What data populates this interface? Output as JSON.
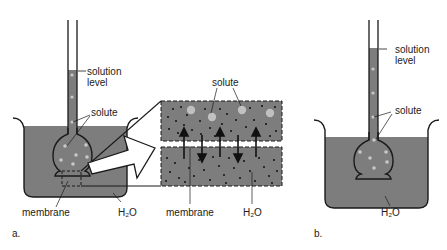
{
  "colors": {
    "water": "#7d7d7d",
    "outline": "#1a1a1a",
    "solute_dot": "#c8c8c8",
    "water_dot": "#111111",
    "background": "#ffffff"
  },
  "panel_a": {
    "label": "a.",
    "labels": {
      "solution_level_line1": "solution",
      "solution_level_line2": "level",
      "solute": "solute",
      "membrane": "membrane",
      "water": "H₂O"
    }
  },
  "inset": {
    "labels": {
      "solute": "solute",
      "membrane": "membrane",
      "water": "H₂O"
    },
    "arrows": [
      "up",
      "down",
      "up",
      "down",
      "up"
    ]
  },
  "panel_b": {
    "label": "b.",
    "labels": {
      "solution_level_line1": "solution",
      "solution_level_line2": "level",
      "solute": "solute",
      "water": "H₂O"
    }
  }
}
